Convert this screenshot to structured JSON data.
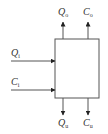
{
  "diagram": {
    "type": "block-flow",
    "block": {
      "label": ""
    },
    "inputs": [
      {
        "var": "Q",
        "sub": "i",
        "direction": "in-left"
      },
      {
        "var": "C",
        "sub": "i",
        "direction": "in-left"
      }
    ],
    "outputs_top": [
      {
        "var": "Q",
        "sub": "o",
        "direction": "out-up"
      },
      {
        "var": "C",
        "sub": "o",
        "direction": "out-up"
      }
    ],
    "outputs_bottom": [
      {
        "var": "Q",
        "sub": "u",
        "direction": "out-down"
      },
      {
        "var": "C",
        "sub": "u",
        "direction": "out-down"
      }
    ],
    "colors": {
      "stroke": "#555555",
      "text": "#333333",
      "background": "#ffffff"
    }
  }
}
